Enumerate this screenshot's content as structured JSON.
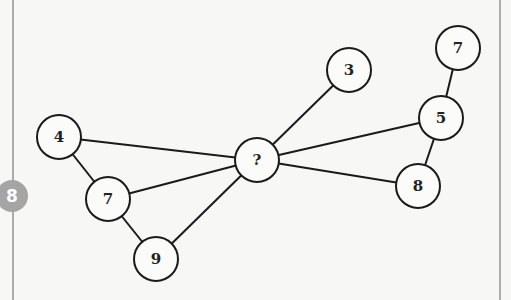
{
  "question_badge": {
    "label": "8",
    "color": "#a5a5a5"
  },
  "nodes": [
    {
      "id": "n4",
      "label": "4",
      "x": 59,
      "y": 137
    },
    {
      "id": "n7a",
      "label": "7",
      "x": 108,
      "y": 199
    },
    {
      "id": "n9",
      "label": "9",
      "x": 156,
      "y": 259
    },
    {
      "id": "nq",
      "label": "?",
      "x": 257,
      "y": 160
    },
    {
      "id": "n3",
      "label": "3",
      "x": 349,
      "y": 70
    },
    {
      "id": "n7b",
      "label": "7",
      "x": 458,
      "y": 48
    },
    {
      "id": "n5",
      "label": "5",
      "x": 441,
      "y": 118
    },
    {
      "id": "n8",
      "label": "8",
      "x": 418,
      "y": 186
    }
  ],
  "edges": [
    [
      "n4",
      "n7a"
    ],
    [
      "n4",
      "nq"
    ],
    [
      "n7a",
      "nq"
    ],
    [
      "n7a",
      "n9"
    ],
    [
      "n9",
      "nq"
    ],
    [
      "nq",
      "n3"
    ],
    [
      "nq",
      "n5"
    ],
    [
      "nq",
      "n8"
    ],
    [
      "n5",
      "n7b"
    ],
    [
      "n5",
      "n8"
    ]
  ],
  "node_radius": 22,
  "colors": {
    "stroke": "#1a1a1a",
    "background": "#f7f7f5"
  }
}
